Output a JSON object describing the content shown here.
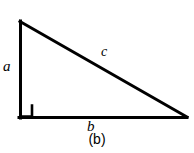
{
  "figure": {
    "type": "geometry-diagram",
    "shape": "right-triangle",
    "caption": "(b)",
    "background_color": "#ffffff",
    "stroke_color": "#000000",
    "stroke_width": 3,
    "vertices": {
      "apex": {
        "x": 19,
        "y": 21
      },
      "right_angle_corner": {
        "x": 19,
        "y": 118
      },
      "right_vertex": {
        "x": 187,
        "y": 118
      }
    },
    "right_angle_marker": {
      "present": true,
      "x": 21,
      "y": 105,
      "size": 11
    },
    "sides": [
      {
        "name": "vertical-leg",
        "label": "a"
      },
      {
        "name": "hypotenuse",
        "label": "c"
      },
      {
        "name": "horizontal-leg",
        "label": "b"
      }
    ],
    "labels": {
      "leg_a": "a",
      "hypotenuse_c": "c",
      "leg_b": "b"
    }
  }
}
